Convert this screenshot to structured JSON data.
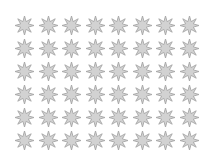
{
  "canvas": {
    "width": 207,
    "height": 162,
    "background_color": "#ffffff"
  },
  "pattern": {
    "name": "star-grid",
    "icon_name": "eight-pointed-star-icon",
    "rows": 6,
    "columns": 8,
    "total_count": 48,
    "star_points": 8,
    "star_size_px": 19,
    "column_spacing_px": 23.5,
    "row_spacing_px": 23.0,
    "grid_left_px": 15,
    "grid_top_px": 16,
    "fill_color": "#d2d2d2",
    "stroke_color": "#a6a6a6",
    "stroke_width_px": 0.9,
    "inner_radius_ratio": 0.44,
    "rotation_deg": 0
  }
}
